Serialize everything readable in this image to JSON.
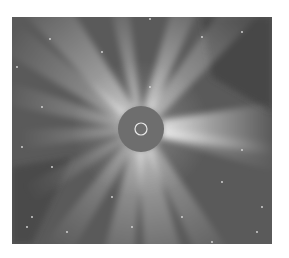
{
  "image": {
    "description": "Grayscale coronagraph view of the solar corona with bright radial streamers around a central occulting disk",
    "colors": {
      "page_background": "#ffffff",
      "sky_background": "#5a5a5a",
      "occulter": "#6e6e6e",
      "sun_limb_circle": "#e8e8e8",
      "streamer": "#f4f4f4"
    },
    "occulter": {
      "cx": 129,
      "cy": 112,
      "r": 23
    },
    "sun_limb": {
      "cx": 129,
      "cy": 112,
      "r": 6
    },
    "streamers": [
      {
        "angle": -100,
        "length": 120,
        "width": 10,
        "opacity": 0.5
      },
      {
        "angle": -70,
        "length": 130,
        "width": 14,
        "opacity": 0.6
      },
      {
        "angle": -50,
        "length": 150,
        "width": 18,
        "opacity": 0.45
      },
      {
        "angle": -128,
        "length": 150,
        "width": 22,
        "opacity": 0.55
      },
      {
        "angle": -145,
        "length": 140,
        "width": 16,
        "opacity": 0.4
      },
      {
        "angle": -165,
        "length": 120,
        "width": 12,
        "opacity": 0.35
      },
      {
        "angle": 0,
        "length": 110,
        "width": 26,
        "opacity": 0.75
      },
      {
        "angle": 12,
        "length": 120,
        "width": 14,
        "opacity": 0.35
      },
      {
        "angle": 60,
        "length": 140,
        "width": 16,
        "opacity": 0.4
      },
      {
        "angle": 80,
        "length": 140,
        "width": 22,
        "opacity": 0.5
      },
      {
        "angle": 100,
        "length": 140,
        "width": 18,
        "opacity": 0.45
      },
      {
        "angle": 125,
        "length": 130,
        "width": 14,
        "opacity": 0.35
      },
      {
        "angle": 150,
        "length": 110,
        "width": 10,
        "opacity": 0.25
      },
      {
        "angle": 175,
        "length": 100,
        "width": 10,
        "opacity": 0.3
      }
    ],
    "stars": [
      [
        5,
        50
      ],
      [
        38,
        22
      ],
      [
        90,
        35
      ],
      [
        138,
        2
      ],
      [
        190,
        20
      ],
      [
        230,
        15
      ],
      [
        30,
        90
      ],
      [
        10,
        130
      ],
      [
        40,
        150
      ],
      [
        230,
        133
      ],
      [
        210,
        165
      ],
      [
        250,
        190
      ],
      [
        20,
        200
      ],
      [
        15,
        210
      ],
      [
        55,
        215
      ],
      [
        120,
        210
      ],
      [
        170,
        200
      ],
      [
        200,
        225
      ],
      [
        245,
        215
      ],
      [
        100,
        180
      ],
      [
        138,
        70
      ]
    ]
  }
}
